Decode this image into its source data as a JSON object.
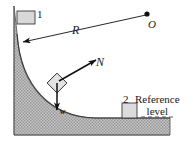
{
  "figure": {
    "colors": {
      "shading": "#b9b9b9",
      "shading_edge": "#6e6e6e",
      "stroke": "#111111",
      "text": "#1a1a1a",
      "block_fill": "#d8d8d8",
      "dashed_line": "#555555"
    },
    "labels": {
      "radius": "R",
      "center_point": "O",
      "position_1": "1",
      "normal_force": "N",
      "weight": "w",
      "position_2": "2",
      "reference_line_1": "Reference",
      "reference_line_2": "level"
    },
    "icons": {
      "center_dot": "filled-dot",
      "radius_arrow": "arrow-head",
      "normal_arrow": "arrow-head",
      "weight_arrow": "arrow-head"
    }
  }
}
